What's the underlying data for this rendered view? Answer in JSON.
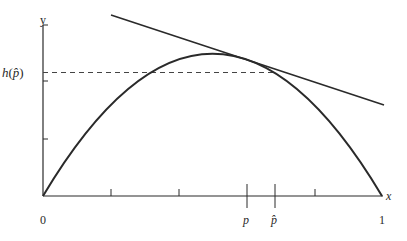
{
  "figure": {
    "colors": {
      "stroke": "#2a2a2a",
      "background": "#ffffff"
    },
    "axes": {
      "x_label": "x",
      "y_label": "y",
      "x_tick_labels": {
        "origin": "0",
        "p": "p",
        "p_hat": "p̂",
        "one": "1"
      },
      "y_tick_label": "h(p̂)",
      "h_func": "h",
      "h_open": "(",
      "h_arg": "p̂",
      "h_close": ")"
    },
    "elements": {
      "curve": "concave arc from (0,0) to (1,0)",
      "tangent_line": "line tangent to curve at p",
      "dashed_line": "horizontal dashed line at y = h(p-hat) from y-axis to curve"
    }
  }
}
